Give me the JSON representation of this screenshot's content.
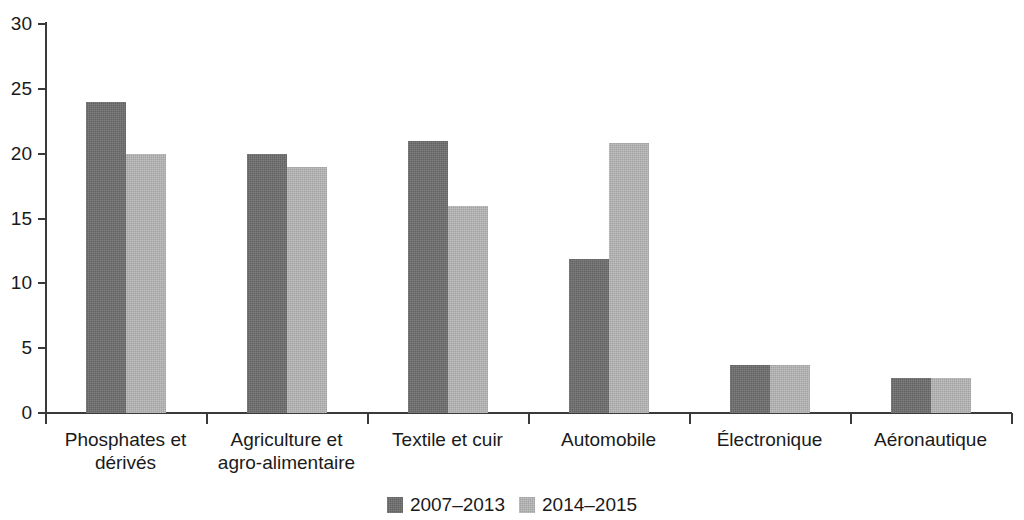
{
  "chart_data": {
    "type": "bar",
    "title": "",
    "subtitle": "",
    "xlabel": "",
    "ylabel": "",
    "ylim": [
      0,
      30
    ],
    "yticks": [
      0,
      5,
      10,
      15,
      20,
      25,
      30
    ],
    "ytick_labels": [
      "0",
      "5",
      "10",
      "15",
      "20",
      "25",
      "30"
    ],
    "grid": false,
    "legend_position": "bottom-center",
    "categories": [
      "Phosphates et dérivés",
      "Agriculture et agro-alimentaire",
      "Textile et cuir",
      "Automobile",
      "Électronique",
      "Aéronautique"
    ],
    "category_label_lines": [
      [
        "Phosphates et",
        "dérivés"
      ],
      [
        "Agriculture et",
        "agro-alimentaire"
      ],
      [
        "Textile et cuir"
      ],
      [
        "Automobile"
      ],
      [
        "Électronique"
      ],
      [
        "Aéronautique"
      ]
    ],
    "series": [
      {
        "name": "2007–2013",
        "color": "#6f6f6f",
        "values": [
          24,
          20,
          21,
          11.9,
          3.7,
          2.7
        ]
      },
      {
        "name": "2014–2015",
        "color": "#b5b5b5",
        "values": [
          20,
          19,
          16,
          20.8,
          3.7,
          2.7
        ]
      }
    ]
  },
  "legend": {
    "items": [
      {
        "label": "2007–2013",
        "color": "#6f6f6f"
      },
      {
        "label": "2014–2015",
        "color": "#b5b5b5"
      }
    ]
  },
  "axis": {
    "y_tick_labels": [
      "30",
      "25",
      "20",
      "15",
      "10",
      "5",
      "0"
    ]
  }
}
